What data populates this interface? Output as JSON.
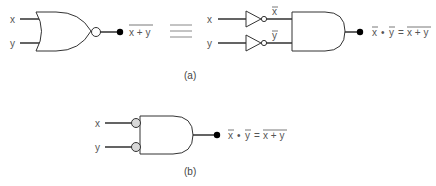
{
  "diagram": {
    "colors": {
      "line": "#222222",
      "text": "#555555",
      "bubble_fill_b": "#d8d8d8",
      "dot": "#000000"
    },
    "part_a": {
      "caption": "(a)",
      "left": {
        "inputs": [
          "x",
          "y"
        ],
        "gate": "NOR",
        "output": {
          "expr": "x + y",
          "overline": true
        }
      },
      "equivalence_symbol": "≡",
      "right": {
        "inputs": [
          "x",
          "y"
        ],
        "inverters": [
          {
            "input": "x",
            "output_label": "x",
            "overline": true
          },
          {
            "input": "y",
            "output_label": "y",
            "overline": true
          }
        ],
        "gate": "AND",
        "output": {
          "lhs_a": "x",
          "dot": "•",
          "lhs_b": "y",
          "equals": "=",
          "rhs": "x + y"
        }
      }
    },
    "part_b": {
      "caption": "(b)",
      "inputs": [
        "x",
        "y"
      ],
      "gate": "AND with inverted inputs",
      "output": {
        "lhs_a": "x",
        "dot": "•",
        "lhs_b": "y",
        "equals": "=",
        "rhs": "x + y"
      }
    }
  }
}
